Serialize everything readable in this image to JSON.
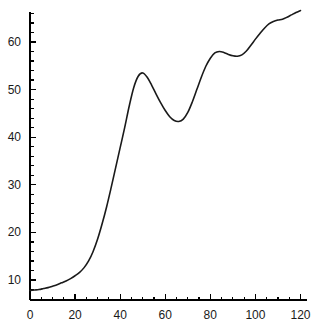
{
  "chart_data": {
    "type": "line",
    "title": "",
    "subtitle": "",
    "xlabel": "",
    "ylabel": "",
    "xlim": [
      0,
      122
    ],
    "ylim": [
      7,
      68
    ],
    "grid": false,
    "legend": null,
    "axis_color": "#000000",
    "line_color": "#1a1a1a",
    "background_color": "#ffffff",
    "xticks": [
      0,
      20,
      40,
      60,
      80,
      100,
      120
    ],
    "xtick_labels": [
      "0",
      "20",
      "40",
      "60",
      "80",
      "100",
      "120"
    ],
    "x_minor_tick_step": 5,
    "yticks": [
      10,
      20,
      30,
      40,
      50,
      60
    ],
    "ytick_labels": [
      "10",
      "20",
      "30",
      "40",
      "50",
      "60"
    ],
    "y_minor_tick_step": 2,
    "series": [
      {
        "name": "curve",
        "x": [
          0,
          2,
          4,
          6,
          8,
          10,
          12,
          14,
          16,
          18,
          20,
          22,
          24,
          26,
          28,
          30,
          32,
          34,
          36,
          38,
          40,
          42,
          44,
          46,
          48,
          50,
          52,
          54,
          56,
          58,
          60,
          62,
          64,
          66,
          68,
          70,
          72,
          74,
          76,
          78,
          80,
          82,
          84,
          86,
          88,
          90,
          92,
          94,
          96,
          98,
          100,
          102,
          104,
          106,
          108,
          110,
          112,
          114,
          116,
          118,
          120
        ],
        "y": [
          7.8,
          7.9,
          8.0,
          8.2,
          8.4,
          8.7,
          9.0,
          9.4,
          9.8,
          10.3,
          10.9,
          11.6,
          12.6,
          14.0,
          16.0,
          18.6,
          21.8,
          25.4,
          29.4,
          33.6,
          37.8,
          42.0,
          46.5,
          50.4,
          52.8,
          53.5,
          52.6,
          50.9,
          49.0,
          47.2,
          45.6,
          44.3,
          43.5,
          43.3,
          43.8,
          45.2,
          47.4,
          50.0,
          52.6,
          54.9,
          56.6,
          57.7,
          58.0,
          57.8,
          57.4,
          57.1,
          57.0,
          57.3,
          58.1,
          59.3,
          60.6,
          61.8,
          62.9,
          63.8,
          64.3,
          64.6,
          64.8,
          65.2,
          65.7,
          66.2,
          66.6
        ]
      }
    ]
  },
  "caption": {
    "text": ""
  }
}
